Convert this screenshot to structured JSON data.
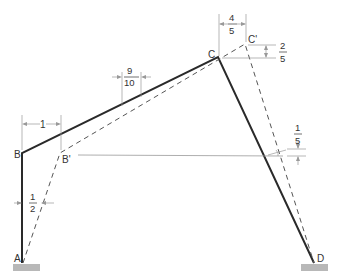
{
  "diagram": {
    "type": "deflected frame",
    "colors": {
      "member": "#2a2a2a",
      "deflected": "#555555",
      "dim": "#8a8a8a",
      "ground": "#b5b5b5"
    },
    "points": {
      "A": "A",
      "B": "B",
      "B_prime": "B'",
      "C": "C",
      "C_prime": "C'",
      "D": "D"
    },
    "dimensions": {
      "bb_horizontal": "1",
      "a_mid": {
        "num": "1",
        "den": "2"
      },
      "bc_mid": {
        "num": "9",
        "den": "10"
      },
      "cc_horizontal": {
        "num": "4",
        "den": "5"
      },
      "cc_vertical": {
        "num": "2",
        "den": "5"
      },
      "d_right": {
        "num": "1",
        "den": "5"
      }
    }
  }
}
